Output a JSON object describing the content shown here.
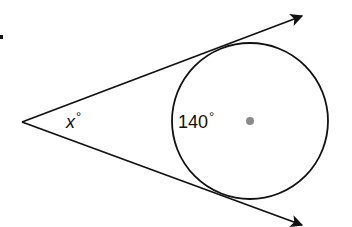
{
  "figure": {
    "type": "geometry-diagram",
    "vertex": {
      "x": 22,
      "y": 122
    },
    "rays": [
      {
        "name": "upper-tangent-ray",
        "from": [
          22,
          122
        ],
        "to": [
          302,
          16
        ]
      },
      {
        "name": "lower-tangent-ray",
        "from": [
          22,
          122
        ],
        "to": [
          302,
          225
        ]
      }
    ],
    "circle": {
      "cx": 250,
      "cy": 121,
      "r": 78
    },
    "center_dot": {
      "cx": 250,
      "cy": 121,
      "r": 4,
      "color": "#8a8a8a"
    },
    "stray_mark": {
      "x": 1,
      "y": 37
    },
    "stroke_color": "#111111"
  },
  "labels": {
    "angle_variable": "x",
    "angle_degree_symbol": "°",
    "arc_measure": "140",
    "arc_degree_symbol": "°"
  }
}
